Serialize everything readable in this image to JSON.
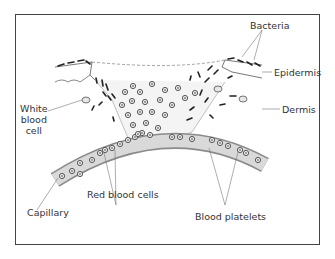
{
  "diagram": {
    "labels": {
      "bacteria": "Bacteria",
      "epidermis": "Epidermis",
      "dermis": "Dermis",
      "white_blood_cell_line1": "White",
      "white_blood_cell_line2": "blood",
      "white_blood_cell_line3": "cell",
      "capillary": "Capillary",
      "red_blood_cells": "Red blood cells",
      "blood_platelets": "Blood platelets"
    },
    "colors": {
      "frame": "#444444",
      "capillary_fill": "#d9d9d9",
      "capillary_edge": "#8a8a8a",
      "cell_ring": "#555555",
      "bacteria": "#222222",
      "text": "#333333"
    }
  }
}
